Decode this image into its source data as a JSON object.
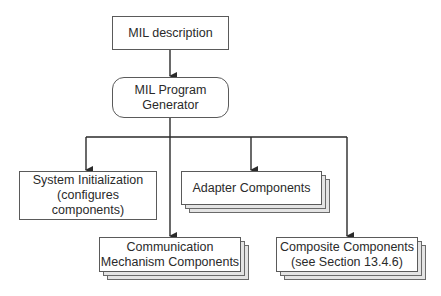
{
  "diagram": {
    "nodes": {
      "mil_description": {
        "label": "MIL description",
        "shape": "rectangle"
      },
      "program_generator": {
        "label": "MIL Program\nGenerator",
        "shape": "rounded-rectangle"
      },
      "system_init": {
        "label": "System Initialization\n(configures\ncomponents)",
        "shape": "rectangle"
      },
      "adapter": {
        "label": "Adapter Components",
        "shape": "stacked-rectangle"
      },
      "communication": {
        "label": "Communication\nMechanism Components",
        "shape": "stacked-rectangle"
      },
      "composite": {
        "label": "Composite Components\n(see Section 13.4.6)",
        "shape": "stacked-rectangle"
      }
    },
    "edges": [
      {
        "from": "mil_description",
        "to": "program_generator"
      },
      {
        "from": "program_generator",
        "to": "system_init"
      },
      {
        "from": "program_generator",
        "to": "adapter"
      },
      {
        "from": "program_generator",
        "to": "communication"
      },
      {
        "from": "program_generator",
        "to": "composite"
      }
    ],
    "colors": {
      "line": "#2a2a2a",
      "border": "#5a5a5a",
      "stack_fill": "#e4e4e4",
      "background": "#ffffff"
    }
  }
}
